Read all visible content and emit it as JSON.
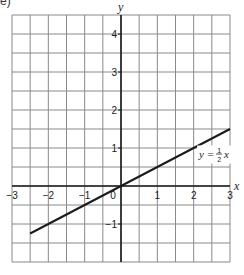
{
  "part_label": "e)",
  "chart_data": {
    "type": "line",
    "title": "",
    "xlabel": "x",
    "ylabel": "y",
    "xlim": [
      -3,
      3
    ],
    "ylim": [
      -2,
      4.5
    ],
    "grid": true,
    "grid_step": 0.5,
    "x_ticks": [
      -3,
      -2,
      -1,
      0,
      1,
      2,
      3
    ],
    "x_tick_labels": [
      "−3",
      "−2",
      "−1",
      "0",
      "1",
      "2",
      "3"
    ],
    "y_ticks": [
      -1,
      1,
      2,
      3,
      4
    ],
    "y_tick_labels": [
      "−1",
      "1",
      "2",
      "3",
      "4"
    ],
    "series": [
      {
        "name": "y = ½x",
        "equation": "y = 1/2 x",
        "x": [
          -2.5,
          3
        ],
        "y": [
          -1.25,
          1.5
        ],
        "color": "#1a1a1a"
      }
    ],
    "annotations": [
      {
        "text_prefix": "y = ",
        "fraction_num": "1",
        "fraction_den": "2",
        "text_suffix": "x",
        "x": 2.15,
        "y": 0.75
      }
    ]
  },
  "colors": {
    "grid": "#8a8a8a",
    "axis": "#1a1a1a",
    "line": "#1a1a1a",
    "text": "#1a1a1a"
  }
}
